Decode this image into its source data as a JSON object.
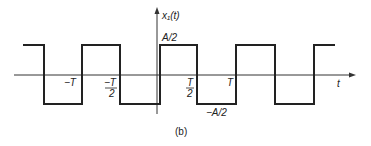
{
  "figure": {
    "caption": "(b)",
    "y_axis_label": "x₁(t)",
    "x_axis_label": "t",
    "high_level_label": "A/2",
    "low_level_label": "−A/2",
    "tick_labels": {
      "neg_T": "−T",
      "neg_T_half_num": "−T",
      "neg_T_half_den": "2",
      "T_half_num": "T",
      "T_half_den": "2",
      "T": "T"
    }
  },
  "waveform": {
    "type": "square-wave",
    "amplitude_high": "A/2",
    "amplitude_low": "-A/2",
    "transitions": [
      "-3T/2",
      "-T",
      "-T/2",
      "0",
      "T/2",
      "T",
      "3T/2",
      "2T"
    ]
  }
}
